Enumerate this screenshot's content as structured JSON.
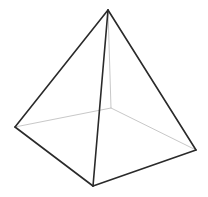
{
  "diagram": {
    "title": "",
    "shape": "square-pyramid-wireframe",
    "background": "#ffffff",
    "colors": {
      "visible_edge": "#2a2a2a",
      "hidden_edge": "#c8c8c8"
    },
    "vertices": {
      "apex": [
        108,
        10
      ],
      "left": [
        15,
        127
      ],
      "front": [
        93,
        186
      ],
      "right": [
        196,
        150
      ],
      "back": [
        111,
        108
      ]
    },
    "edges": [
      {
        "name": "apex-left",
        "from": "apex",
        "to": "left",
        "hidden": false
      },
      {
        "name": "apex-front",
        "from": "apex",
        "to": "front",
        "hidden": false
      },
      {
        "name": "apex-right",
        "from": "apex",
        "to": "right",
        "hidden": false
      },
      {
        "name": "left-front",
        "from": "left",
        "to": "front",
        "hidden": false
      },
      {
        "name": "front-right",
        "from": "front",
        "to": "right",
        "hidden": false
      },
      {
        "name": "apex-back",
        "from": "apex",
        "to": "back",
        "hidden": true
      },
      {
        "name": "left-back",
        "from": "left",
        "to": "back",
        "hidden": true
      },
      {
        "name": "back-right",
        "from": "back",
        "to": "right",
        "hidden": true
      }
    ]
  }
}
